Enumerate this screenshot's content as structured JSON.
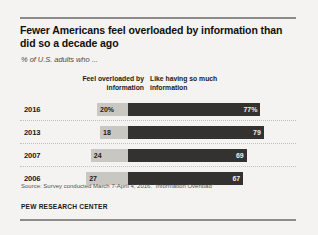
{
  "chart_data": {
    "type": "bar",
    "title": "Fewer Americans feel overloaded by information than did so a decade ago",
    "subtitle": "% of U.S. adults who ...",
    "categories": [
      "2016",
      "2013",
      "2007",
      "2006"
    ],
    "series": [
      {
        "name": "Feel overloaded by information",
        "values": [
          20,
          18,
          24,
          27
        ],
        "labels": [
          "20%",
          "18",
          "24",
          "27"
        ],
        "color": "#c9c7c2",
        "direction": "left"
      },
      {
        "name": "Like having so much information",
        "values": [
          77,
          79,
          69,
          67
        ],
        "labels": [
          "77%",
          "79",
          "69",
          "67"
        ],
        "color": "#333230",
        "direction": "right"
      }
    ],
    "xlabel": "",
    "ylabel": "",
    "xlim": [
      0,
      100
    ],
    "grid": false,
    "legend": "column-headers-above"
  },
  "header": {
    "title": "Fewer Americans feel overloaded by information than did so a decade ago",
    "subtitle": "% of U.S. adults who ..."
  },
  "columns": {
    "left_label": "Feel overloaded by information",
    "right_label": "Like having so much information"
  },
  "rows": [
    {
      "year": "2016",
      "left_value": "20%",
      "right_value": "77%"
    },
    {
      "year": "2013",
      "left_value": "18",
      "right_value": "79"
    },
    {
      "year": "2007",
      "left_value": "24",
      "right_value": "69"
    },
    {
      "year": "2006",
      "left_value": "27",
      "right_value": "67"
    }
  ],
  "footer": {
    "source": "Source: Survey conducted March 7-April 4, 2016. “Information Overload”",
    "brand": "PEW RESEARCH CENTER"
  },
  "colors": {
    "bar_left": "#c9c7c2",
    "bar_right": "#333230",
    "rule": "#8d8b87",
    "background": "#f4f3f1"
  }
}
